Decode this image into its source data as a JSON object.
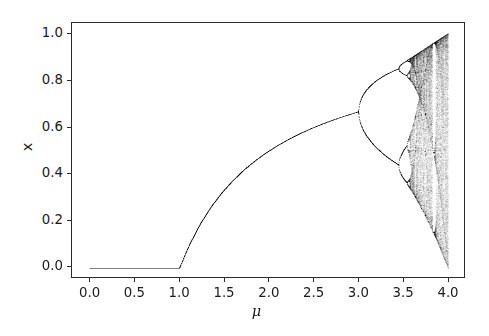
{
  "figure": {
    "background_color": "#ffffff",
    "axes_edge_color": "#2b2b2b",
    "tick_color": "#2b2b2b",
    "text_color": "#1a1a1a"
  },
  "chart_data": {
    "type": "scatter",
    "title": "",
    "subtitle": "",
    "xlabel": "μ",
    "ylabel": "x",
    "xlim": [
      -0.2,
      4.2
    ],
    "ylim": [
      -0.045,
      1.045
    ],
    "xticks": [
      0.0,
      0.5,
      1.0,
      1.5,
      2.0,
      2.5,
      3.0,
      3.5,
      4.0
    ],
    "xticklabels": [
      "0.0",
      "0.5",
      "1.0",
      "1.5",
      "2.0",
      "2.5",
      "3.0",
      "3.5",
      "4.0"
    ],
    "yticks": [
      0.0,
      0.2,
      0.4,
      0.6,
      0.8,
      1.0
    ],
    "yticklabels": [
      "0.0",
      "0.2",
      "0.4",
      "0.6",
      "0.8",
      "1.0"
    ],
    "grid": false,
    "legend": "none",
    "marker_color": "#000000",
    "marker_size_px": 0.55,
    "marker_alpha": 0.14,
    "model": {
      "equation": "x_{n+1} = mu*x_n*(1 - x_n)",
      "mu_min": 0.0,
      "mu_max": 4.0,
      "mu_steps": 1400,
      "x0": 0.35,
      "transient_iterations": 320,
      "recorded_iterations": 220
    },
    "annotations": [
      {
        "label": "stable fixed point x = 0",
        "mu_range": [
          0.0,
          1.0
        ],
        "x_value": 0.0
      },
      {
        "label": "stable fixed point x = 1 - 1/mu",
        "mu_range": [
          1.0,
          3.0
        ],
        "x_at_mu_2": 0.5,
        "x_at_mu_3": 0.667
      },
      {
        "label": "first period-doubling bifurcation",
        "mu": 3.0,
        "x_value": 0.667
      },
      {
        "label": "period-4 bifurcation",
        "mu": 3.449,
        "x_values": [
          0.85,
          0.44
        ]
      },
      {
        "label": "period-8 bifurcation",
        "mu": 3.544
      },
      {
        "label": "onset of chaos (Feigenbaum point)",
        "mu": 3.5699
      },
      {
        "label": "period-3 window",
        "mu_range": [
          3.828,
          3.857
        ]
      },
      {
        "label": "full chaos",
        "mu": 4.0,
        "x_range": [
          0.0,
          1.0
        ]
      }
    ],
    "reference_curve": {
      "name": "x = 1 - 1/mu",
      "samples": [
        {
          "mu": 1.0,
          "x": 0.0
        },
        {
          "mu": 1.25,
          "x": 0.2
        },
        {
          "mu": 1.5,
          "x": 0.333
        },
        {
          "mu": 1.75,
          "x": 0.429
        },
        {
          "mu": 2.0,
          "x": 0.5
        },
        {
          "mu": 2.5,
          "x": 0.6
        },
        {
          "mu": 3.0,
          "x": 0.667
        }
      ]
    }
  }
}
